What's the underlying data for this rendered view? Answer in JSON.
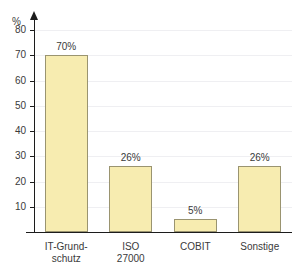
{
  "chart_data": {
    "type": "bar",
    "title": "",
    "xlabel": "",
    "ylabel": "%",
    "ylim": [
      0,
      80
    ],
    "ytick_step": 10,
    "grid": true,
    "legend": "none",
    "categories": [
      "IT-Grund-schutz",
      "ISO 27000",
      "COBIT",
      "Sonstige"
    ],
    "category_lines": [
      [
        "IT-Grund-",
        "schutz"
      ],
      [
        "ISO",
        "27000"
      ],
      [
        "COBIT"
      ],
      [
        "Sonstige"
      ]
    ],
    "values": [
      70,
      26,
      5,
      26
    ],
    "value_labels": [
      "70%",
      "26%",
      "5%",
      "26%"
    ],
    "ytick_labels": [
      "10",
      "20",
      "30",
      "40",
      "50",
      "60",
      "70",
      "80"
    ],
    "colors": {
      "bar_fill": "#F7ECB0",
      "bar_border": "#9A9470",
      "axis": "#1C1C1C",
      "grid": "#EFEFF2",
      "text": "#3A3A3A",
      "background": "#FFFFFF"
    }
  }
}
